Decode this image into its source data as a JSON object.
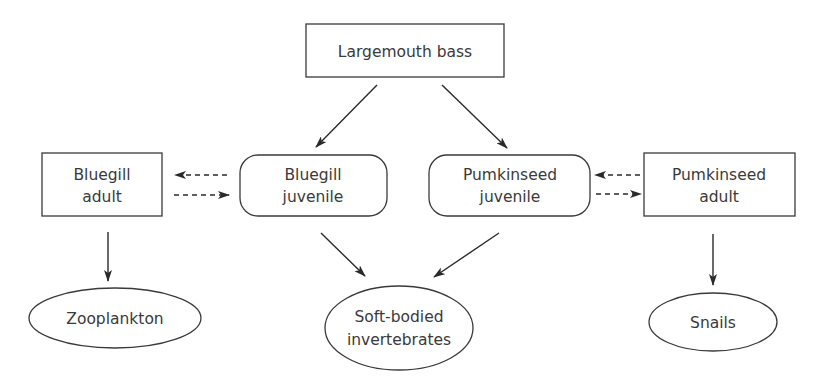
{
  "diagram": {
    "type": "food-web",
    "nodes": {
      "largemouth_bass": {
        "label": "Largemouth bass",
        "shape": "rectangle"
      },
      "bluegill_adult": {
        "line1": "Bluegill",
        "line2": "adult",
        "shape": "rectangle"
      },
      "bluegill_juvenile": {
        "line1": "Bluegill",
        "line2": "juvenile",
        "shape": "rounded-rectangle"
      },
      "pumkinseed_juvenile": {
        "line1": "Pumkinseed",
        "line2": "juvenile",
        "shape": "rounded-rectangle"
      },
      "pumkinseed_adult": {
        "line1": "Pumkinseed",
        "line2": "adult",
        "shape": "rectangle"
      },
      "zooplankton": {
        "label": "Zooplankton",
        "shape": "ellipse"
      },
      "soft_bodied_invertebrates": {
        "line1": "Soft-bodied",
        "line2": "invertebrates",
        "shape": "ellipse"
      },
      "snails": {
        "label": "Snails",
        "shape": "ellipse"
      }
    },
    "edges": [
      {
        "from": "Largemouth bass",
        "to": "Bluegill juvenile",
        "style": "solid"
      },
      {
        "from": "Largemouth bass",
        "to": "Pumkinseed juvenile",
        "style": "solid"
      },
      {
        "from": "Bluegill juvenile",
        "to": "Bluegill adult",
        "style": "dashed"
      },
      {
        "from": "Bluegill adult",
        "to": "Bluegill juvenile",
        "style": "dashed"
      },
      {
        "from": "Pumkinseed adult",
        "to": "Pumkinseed juvenile",
        "style": "dashed"
      },
      {
        "from": "Pumkinseed juvenile",
        "to": "Pumkinseed adult",
        "style": "dashed"
      },
      {
        "from": "Bluegill adult",
        "to": "Zooplankton",
        "style": "solid"
      },
      {
        "from": "Bluegill juvenile",
        "to": "Soft-bodied invertebrates",
        "style": "solid"
      },
      {
        "from": "Pumkinseed juvenile",
        "to": "Soft-bodied invertebrates",
        "style": "solid"
      },
      {
        "from": "Pumkinseed adult",
        "to": "Snails",
        "style": "solid"
      }
    ],
    "colors": {
      "stroke": "#3a3a3a",
      "text": "#3a3a3a",
      "background": "#ffffff"
    }
  }
}
